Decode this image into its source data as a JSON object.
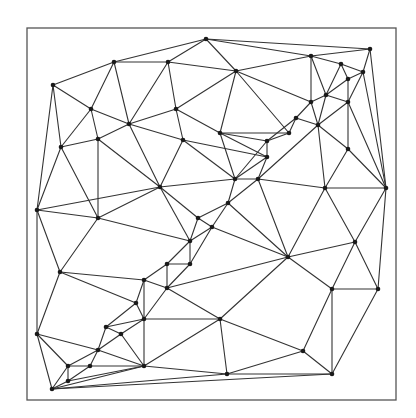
{
  "diagram": {
    "type": "triangulation",
    "frame": {
      "x": 27,
      "y": 28,
      "width": 369,
      "height": 372
    },
    "colors": {
      "edge": "#333333",
      "node": "#1a1a1a",
      "frame": "#555555",
      "background": "#ffffff"
    },
    "points": [
      [
        206,
        39
      ],
      [
        114,
        62
      ],
      [
        168,
        62
      ],
      [
        53,
        85
      ],
      [
        91,
        109
      ],
      [
        176,
        109
      ],
      [
        129,
        124
      ],
      [
        98,
        139
      ],
      [
        183,
        140
      ],
      [
        220,
        133
      ],
      [
        61,
        147
      ],
      [
        236,
        71
      ],
      [
        311,
        56
      ],
      [
        370,
        49
      ],
      [
        341,
        64
      ],
      [
        363,
        72
      ],
      [
        348,
        79
      ],
      [
        326,
        95
      ],
      [
        311,
        102
      ],
      [
        348,
        102
      ],
      [
        296,
        118
      ],
      [
        289,
        133
      ],
      [
        267,
        141
      ],
      [
        267,
        157
      ],
      [
        318,
        125
      ],
      [
        348,
        149
      ],
      [
        160,
        187
      ],
      [
        235,
        179
      ],
      [
        258,
        179
      ],
      [
        325,
        188
      ],
      [
        386,
        188
      ],
      [
        37,
        210
      ],
      [
        98,
        218
      ],
      [
        228,
        203
      ],
      [
        198,
        218
      ],
      [
        212,
        227
      ],
      [
        190,
        241
      ],
      [
        288,
        257
      ],
      [
        355,
        242
      ],
      [
        167,
        264
      ],
      [
        190,
        264
      ],
      [
        60,
        272
      ],
      [
        144,
        280
      ],
      [
        167,
        288
      ],
      [
        136,
        303
      ],
      [
        144,
        319
      ],
      [
        220,
        319
      ],
      [
        332,
        289
      ],
      [
        378,
        289
      ],
      [
        106,
        327
      ],
      [
        121,
        334
      ],
      [
        37,
        334
      ],
      [
        98,
        350
      ],
      [
        303,
        351
      ],
      [
        68,
        366
      ],
      [
        90,
        366
      ],
      [
        144,
        366
      ],
      [
        68,
        381
      ],
      [
        52,
        389
      ],
      [
        227,
        374
      ],
      [
        332,
        374
      ]
    ],
    "edges": [
      [
        3,
        1
      ],
      [
        1,
        0
      ],
      [
        0,
        13
      ],
      [
        1,
        2
      ],
      [
        2,
        0
      ],
      [
        0,
        11
      ],
      [
        11,
        12
      ],
      [
        12,
        13
      ],
      [
        13,
        15
      ],
      [
        0,
        12
      ],
      [
        3,
        4
      ],
      [
        3,
        10
      ],
      [
        3,
        31
      ],
      [
        1,
        4
      ],
      [
        1,
        6
      ],
      [
        2,
        6
      ],
      [
        2,
        5
      ],
      [
        2,
        11
      ],
      [
        4,
        6
      ],
      [
        4,
        7
      ],
      [
        4,
        10
      ],
      [
        6,
        7
      ],
      [
        6,
        5
      ],
      [
        6,
        8
      ],
      [
        6,
        26
      ],
      [
        5,
        11
      ],
      [
        5,
        8
      ],
      [
        5,
        9
      ],
      [
        11,
        9
      ],
      [
        11,
        21
      ],
      [
        11,
        18
      ],
      [
        7,
        10
      ],
      [
        7,
        26
      ],
      [
        7,
        32
      ],
      [
        10,
        31
      ],
      [
        10,
        32
      ],
      [
        12,
        14
      ],
      [
        12,
        18
      ],
      [
        12,
        17
      ],
      [
        14,
        15
      ],
      [
        14,
        17
      ],
      [
        14,
        16
      ],
      [
        15,
        16
      ],
      [
        15,
        19
      ],
      [
        15,
        30
      ],
      [
        13,
        30
      ],
      [
        16,
        17
      ],
      [
        16,
        19
      ],
      [
        17,
        18
      ],
      [
        17,
        24
      ],
      [
        17,
        19
      ],
      [
        18,
        20
      ],
      [
        18,
        24
      ],
      [
        19,
        24
      ],
      [
        19,
        25
      ],
      [
        19,
        30
      ],
      [
        20,
        21
      ],
      [
        20,
        24
      ],
      [
        20,
        22
      ],
      [
        21,
        9
      ],
      [
        21,
        22
      ],
      [
        22,
        9
      ],
      [
        22,
        23
      ],
      [
        22,
        27
      ],
      [
        23,
        27
      ],
      [
        23,
        28
      ],
      [
        23,
        9
      ],
      [
        23,
        8
      ],
      [
        24,
        25
      ],
      [
        24,
        28
      ],
      [
        24,
        29
      ],
      [
        25,
        29
      ],
      [
        25,
        30
      ],
      [
        28,
        29
      ],
      [
        27,
        28
      ],
      [
        27,
        33
      ],
      [
        28,
        33
      ],
      [
        8,
        26
      ],
      [
        8,
        27
      ],
      [
        9,
        27
      ],
      [
        26,
        27
      ],
      [
        26,
        34
      ],
      [
        26,
        32
      ],
      [
        26,
        36
      ],
      [
        26,
        31
      ],
      [
        29,
        30
      ],
      [
        29,
        37
      ],
      [
        29,
        38
      ],
      [
        30,
        38
      ],
      [
        30,
        48
      ],
      [
        33,
        34
      ],
      [
        33,
        35
      ],
      [
        33,
        37
      ],
      [
        28,
        37
      ],
      [
        34,
        35
      ],
      [
        34,
        36
      ],
      [
        35,
        36
      ],
      [
        35,
        40
      ],
      [
        35,
        37
      ],
      [
        36,
        40
      ],
      [
        36,
        39
      ],
      [
        32,
        36
      ],
      [
        32,
        41
      ],
      [
        32,
        31
      ],
      [
        37,
        38
      ],
      [
        37,
        47
      ],
      [
        37,
        43
      ],
      [
        37,
        46
      ],
      [
        38,
        47
      ],
      [
        38,
        48
      ],
      [
        47,
        48
      ],
      [
        47,
        53
      ],
      [
        47,
        60
      ],
      [
        48,
        60
      ],
      [
        39,
        40
      ],
      [
        39,
        42
      ],
      [
        39,
        43
      ],
      [
        40,
        43
      ],
      [
        41,
        42
      ],
      [
        41,
        31
      ],
      [
        41,
        51
      ],
      [
        41,
        44
      ],
      [
        42,
        44
      ],
      [
        42,
        45
      ],
      [
        42,
        43
      ],
      [
        43,
        46
      ],
      [
        43,
        45
      ],
      [
        44,
        45
      ],
      [
        44,
        49
      ],
      [
        45,
        49
      ],
      [
        45,
        50
      ],
      [
        45,
        46
      ],
      [
        45,
        56
      ],
      [
        46,
        53
      ],
      [
        46,
        59
      ],
      [
        46,
        56
      ],
      [
        49,
        50
      ],
      [
        49,
        52
      ],
      [
        50,
        52
      ],
      [
        50,
        56
      ],
      [
        51,
        52
      ],
      [
        51,
        31
      ],
      [
        51,
        58
      ],
      [
        51,
        54
      ],
      [
        52,
        54
      ],
      [
        52,
        55
      ],
      [
        52,
        56
      ],
      [
        53,
        59
      ],
      [
        53,
        60
      ],
      [
        59,
        60
      ],
      [
        56,
        59
      ],
      [
        54,
        55
      ],
      [
        54,
        57
      ],
      [
        55,
        56
      ],
      [
        55,
        57
      ],
      [
        57,
        58
      ],
      [
        54,
        58
      ],
      [
        57,
        56
      ],
      [
        58,
        56
      ],
      [
        58,
        59
      ],
      [
        58,
        60
      ]
    ]
  }
}
